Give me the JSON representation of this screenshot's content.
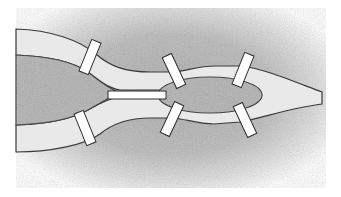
{
  "diagram": {
    "title": "",
    "colors": {
      "background": "#ffffff",
      "land": "#b4b4b4",
      "land_dark": "#9a9a9a",
      "river": "#e9e9e9",
      "river_edge": "#3a3a3a",
      "bridge": "#ffffff",
      "bridge_edge": "#2e2e2e"
    },
    "regions": [
      {
        "id": "north-bank",
        "type": "land"
      },
      {
        "id": "south-bank",
        "type": "land"
      },
      {
        "id": "west-island",
        "type": "island"
      },
      {
        "id": "east-island",
        "type": "island"
      }
    ],
    "bridges": [
      {
        "id": "bridge-1",
        "connects": [
          "north-bank",
          "west-island"
        ]
      },
      {
        "id": "bridge-2",
        "connects": [
          "south-bank",
          "west-island"
        ]
      },
      {
        "id": "bridge-3",
        "connects": [
          "west-island",
          "east-island"
        ]
      },
      {
        "id": "bridge-4",
        "connects": [
          "north-bank",
          "east-island"
        ]
      },
      {
        "id": "bridge-5",
        "connects": [
          "north-bank",
          "east-island"
        ]
      },
      {
        "id": "bridge-6",
        "connects": [
          "south-bank",
          "east-island"
        ]
      },
      {
        "id": "bridge-7",
        "connects": [
          "south-bank",
          "east-island"
        ]
      }
    ]
  }
}
